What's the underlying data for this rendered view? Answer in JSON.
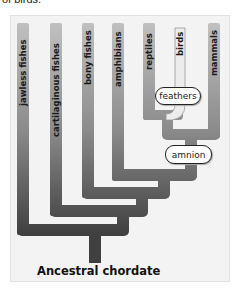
{
  "caption_fragment": "of birds.",
  "diagram": {
    "type": "cladogram",
    "root": "Ancestral chordate",
    "taxa": [
      {
        "label": "jawless fishes"
      },
      {
        "label": "cartilaginous fishes"
      },
      {
        "label": "bony fishes"
      },
      {
        "label": "amphibians"
      },
      {
        "label": "reptiles"
      },
      {
        "label": "birds"
      },
      {
        "label": "mammals"
      }
    ],
    "traits": [
      {
        "label": "feathers"
      },
      {
        "label": "amnion"
      }
    ],
    "colors": {
      "branch_top": "#c4c4c4",
      "branch_bottom": "#404040",
      "bird_branch": "#ececec",
      "panel_bg": "#f3f3f3"
    }
  }
}
